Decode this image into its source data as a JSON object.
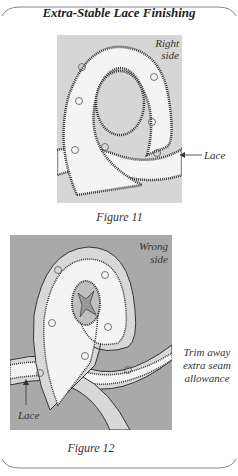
{
  "title": "Extra-Stable Lace Finishing",
  "figures": [
    {
      "caption": "Figure 11",
      "background": "#d6d6d6",
      "labels": {
        "side_line1": "Right",
        "side_line2": "side",
        "lace": "Lace"
      }
    },
    {
      "caption": "Figure 12",
      "background": "#a9a9a9",
      "labels": {
        "side_line1": "Wrong",
        "side_line2": "side",
        "trim_line1": "Trim away",
        "trim_line2": "extra seam",
        "trim_line3": "allowance",
        "lace": "Lace"
      }
    }
  ]
}
